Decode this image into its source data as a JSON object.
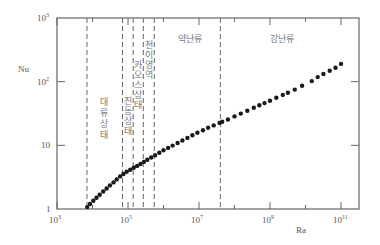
{
  "chart_data": {
    "type": "scatter",
    "title": "",
    "xlabel": "Ra",
    "ylabel": "Nu",
    "xscale": "log",
    "yscale": "log",
    "xlim": [
      1000,
      200000000000
    ],
    "ylim": [
      1,
      1000
    ],
    "grid": false,
    "legend": null,
    "x_ticks": [
      {
        "value": 1000,
        "label_base": "10",
        "label_exp": "3"
      },
      {
        "value": 100000,
        "label_base": "10",
        "label_exp": "5"
      },
      {
        "value": 10000000,
        "label_base": "10",
        "label_exp": "7"
      },
      {
        "value": 1000000000,
        "label_base": "10",
        "label_exp": "9"
      },
      {
        "value": 100000000000,
        "label_base": "10",
        "label_exp": "11"
      }
    ],
    "y_ticks": [
      {
        "value": 1,
        "label_base": "1",
        "label_exp": ""
      },
      {
        "value": 10,
        "label_base": "10",
        "label_exp": ""
      },
      {
        "value": 100,
        "label_base": "10",
        "label_exp": "2"
      },
      {
        "value": 1000,
        "label_base": "10",
        "label_exp": "3"
      }
    ],
    "regime_boundaries_Ra": [
      7000,
      70000,
      140000,
      270000,
      550000,
      40000000
    ],
    "regions": [
      {
        "label": "대류상태",
        "from_Ra": 7000,
        "to_Ra": 70000
      },
      {
        "label": "진동상태",
        "from_Ra": 70000,
        "to_Ra": 140000
      },
      {
        "label": "카오스상태",
        "from_Ra": 140000,
        "to_Ra": 270000
      },
      {
        "label": "천이영역",
        "from_Ra": 270000,
        "to_Ra": 550000
      },
      {
        "label": "약난류",
        "from_Ra": 550000,
        "to_Ra": 40000000
      },
      {
        "label": "강난류",
        "from_Ra": 40000000,
        "to_Ra": 100000000000
      }
    ],
    "series": [
      {
        "name": "Nu vs Ra",
        "points": [
          [
            7100,
            1.07
          ],
          [
            8500,
            1.2
          ],
          [
            10500,
            1.35
          ],
          [
            13000,
            1.5
          ],
          [
            16000,
            1.68
          ],
          [
            20000,
            1.88
          ],
          [
            25000,
            2.1
          ],
          [
            31000,
            2.35
          ],
          [
            39000,
            2.62
          ],
          [
            48000,
            2.92
          ],
          [
            60000,
            3.25
          ],
          [
            74000,
            3.55
          ],
          [
            92000,
            3.85
          ],
          [
            115000,
            4.15
          ],
          [
            145000,
            4.45
          ],
          [
            180000,
            4.75
          ],
          [
            225000,
            5.1
          ],
          [
            280000,
            5.5
          ],
          [
            350000,
            5.95
          ],
          [
            450000,
            6.45
          ],
          [
            580000,
            7.0
          ],
          [
            760000,
            7.65
          ],
          [
            1000000,
            8.35
          ],
          [
            1350000,
            9.1
          ],
          [
            1800000,
            9.9
          ],
          [
            2500000,
            10.9
          ],
          [
            3400000,
            11.9
          ],
          [
            4700000,
            13.1
          ],
          [
            6500000,
            14.4
          ],
          [
            9000000,
            15.8
          ],
          [
            13000000,
            17.3
          ],
          [
            18000000,
            18.9
          ],
          [
            26000000,
            20.6
          ],
          [
            38000000,
            22.5
          ],
          [
            45000000,
            23.5
          ],
          [
            65000000,
            25.5
          ],
          [
            100000000,
            28.5
          ],
          [
            150000000,
            31.5
          ],
          [
            230000000,
            35
          ],
          [
            350000000,
            39
          ],
          [
            500000000,
            42.5
          ],
          [
            700000000,
            46
          ],
          [
            1000000000,
            50
          ],
          [
            1500000000,
            56
          ],
          [
            2300000000,
            62
          ],
          [
            3200000000,
            67
          ],
          [
            5000000000,
            75
          ],
          [
            8000000000,
            86
          ],
          [
            15000000000,
            102
          ],
          [
            22000000000,
            118
          ],
          [
            32000000000,
            132
          ],
          [
            48000000000,
            148
          ],
          [
            70000000000,
            165
          ],
          [
            100000000000,
            190
          ]
        ]
      }
    ]
  }
}
